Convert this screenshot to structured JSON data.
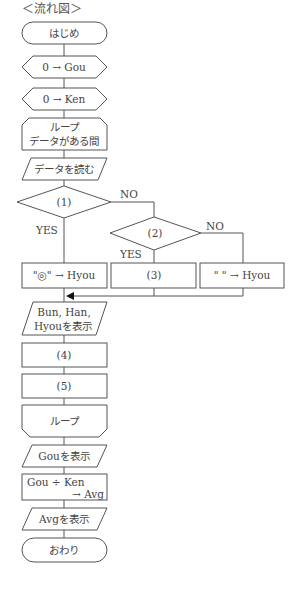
{
  "title": "＜流れ図＞",
  "flowchart": {
    "start": "はじめ",
    "init_gou": "0 → Gou",
    "init_ken": "0 → Ken",
    "loop_start_line1": "ループ",
    "loop_start_line2": "データがある間",
    "read_data": "データを読む",
    "decision1": "(1)",
    "decision1_no": "NO",
    "decision1_yes": "YES",
    "decision2": "(2)",
    "decision2_no": "NO",
    "decision2_yes": "YES",
    "assign_double_circle": "\"◎\" → Hyou",
    "process3": "(3)",
    "assign_blank": "\" \" → Hyou",
    "output_line1": "Bun, Han,",
    "output_line2": "Hyouを表示",
    "process4": "(4)",
    "process5": "(5)",
    "loop_end": "ループ",
    "show_gou": "Gouを表示",
    "divide_line1": "Gou  ÷  Ken",
    "divide_line2": "→ Avg",
    "show_avg": "Avgを表示",
    "end": "おわり"
  }
}
